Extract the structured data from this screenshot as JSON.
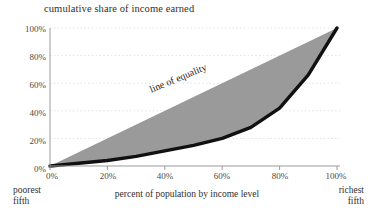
{
  "chart_data": {
    "type": "area",
    "title": "cumulative share of income earned",
    "xlabel": "percent of population by income level",
    "ylabel": "cumulative share of income earned",
    "xlim": [
      0,
      100
    ],
    "ylim": [
      0,
      100
    ],
    "grid": true,
    "legend": "none",
    "x_tick_labels": [
      "0%",
      "20%",
      "40%",
      "60%",
      "80%",
      "100%"
    ],
    "x_ticks": [
      0,
      20,
      40,
      60,
      80,
      100
    ],
    "y_tick_labels": [
      "0%",
      "20%",
      "40%",
      "60%",
      "80%",
      "100%"
    ],
    "y_ticks": [
      0,
      20,
      40,
      60,
      80,
      100
    ],
    "annotations": [
      {
        "text": "line of equality",
        "x": 38,
        "y": 44,
        "rotation": -22.5
      },
      {
        "text": "poorest fifth",
        "position": "axis-left-end"
      },
      {
        "text": "richest fifth",
        "position": "axis-right-end"
      }
    ],
    "series": [
      {
        "name": "line of equality",
        "type": "line",
        "x": [
          0,
          100
        ],
        "values": [
          0,
          100
        ],
        "color": "#8f8f8f"
      },
      {
        "name": "Lorenz curve",
        "type": "line",
        "x": [
          0,
          10,
          20,
          30,
          40,
          50,
          60,
          70,
          80,
          90,
          100
        ],
        "values": [
          0,
          2,
          4,
          7,
          11,
          15,
          20,
          28,
          42,
          66,
          100
        ],
        "color": "#111111"
      }
    ],
    "shaded_region": {
      "name": "inequality gap",
      "between": [
        "line of equality",
        "Lorenz curve"
      ],
      "color": "#9a9a9a"
    }
  },
  "labels": {
    "title": "cumulative share of income earned",
    "x_axis_caption": "percent of population by income level",
    "line_of_equality": "line of equality",
    "poorest_line1": "poorest",
    "poorest_line2": "fifth",
    "richest_line1": "richest",
    "richest_line2": "fifth"
  },
  "colors": {
    "gap_fill": "#9a9a9a",
    "lorenz_curve": "#111111",
    "equality_line": "#8f8f8f",
    "axis": "#9b9b9b",
    "gridline": "#dcdcdc",
    "text": "#3a3a3a",
    "background": "#ffffff"
  }
}
